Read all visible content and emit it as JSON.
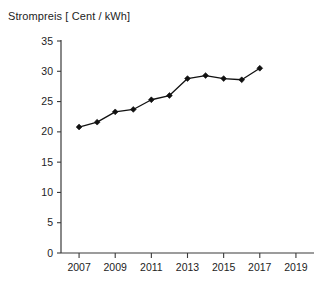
{
  "chart_data": {
    "type": "line",
    "title": "Strompreis [ Cent / kWh]",
    "xlabel": "",
    "ylabel": "",
    "grid": false,
    "legend": false,
    "legend_position": "none",
    "line_color": "#111111",
    "axis_color": "#3a3a3a",
    "marker": "diamond",
    "x": [
      2007,
      2008,
      2009,
      2010,
      2011,
      2012,
      2013,
      2014,
      2015,
      2016,
      2017
    ],
    "values": [
      20.8,
      21.6,
      23.3,
      23.7,
      25.3,
      26.0,
      28.8,
      29.3,
      28.8,
      28.6,
      30.5
    ],
    "series": [
      {
        "name": "Strompreis",
        "values": [
          20.8,
          21.6,
          23.3,
          23.7,
          25.3,
          26.0,
          28.8,
          29.3,
          28.8,
          28.6,
          30.5
        ]
      }
    ],
    "xlim": [
      2006,
      2020
    ],
    "ylim": [
      0,
      35
    ],
    "ytick_labels": [
      "0",
      "5",
      "10",
      "15",
      "20",
      "25",
      "30",
      "35"
    ],
    "ytick_values": [
      0,
      5,
      10,
      15,
      20,
      25,
      30,
      35
    ],
    "xtick_labels": [
      "2007",
      "2009",
      "2011",
      "2013",
      "2015",
      "2017",
      "2019"
    ],
    "xtick_values": [
      2007,
      2009,
      2011,
      2013,
      2015,
      2017,
      2019
    ]
  }
}
